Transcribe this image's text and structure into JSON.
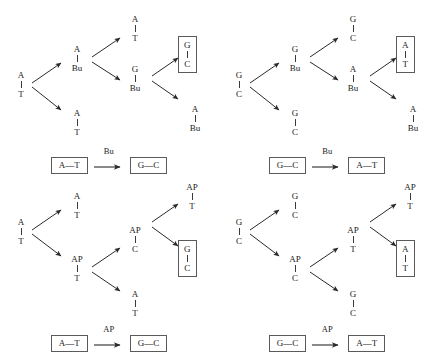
{
  "figure": {
    "top_caption": "",
    "bond_glyph": "|",
    "pair_dash": "—"
  },
  "panels": [
    {
      "id": "panel-bu-at-to-gc",
      "position": "top-left",
      "mutagen": "Bu",
      "root": {
        "top": "A",
        "bot": "T"
      },
      "gen1": [
        {
          "top": "A",
          "bot": "Bu",
          "boxed": false
        },
        {
          "top": "A",
          "bot": "T",
          "boxed": false
        }
      ],
      "gen2": [
        {
          "top": "A",
          "bot": "T",
          "boxed": false
        },
        {
          "top": "G",
          "bot": "Bu",
          "boxed": false
        }
      ],
      "gen3": [
        {
          "top": "G",
          "bot": "C",
          "boxed": true
        },
        {
          "top": "A",
          "bot": "Bu",
          "boxed": false
        }
      ],
      "summary": {
        "from": "A—T",
        "agent": "Bu",
        "to": "G—C"
      }
    },
    {
      "id": "panel-bu-gc-to-at",
      "position": "top-right",
      "mutagen": "Bu",
      "root": {
        "top": "G",
        "bot": "C"
      },
      "gen1": [
        {
          "top": "G",
          "bot": "Bu",
          "boxed": false
        },
        {
          "top": "G",
          "bot": "C",
          "boxed": false
        }
      ],
      "gen2": [
        {
          "top": "G",
          "bot": "C",
          "boxed": false
        },
        {
          "top": "A",
          "bot": "Bu",
          "boxed": false
        }
      ],
      "gen3": [
        {
          "top": "A",
          "bot": "T",
          "boxed": true
        },
        {
          "top": "A",
          "bot": "Bu",
          "boxed": false
        }
      ],
      "summary": {
        "from": "G—C",
        "agent": "Bu",
        "to": "A—T"
      }
    },
    {
      "id": "panel-ap-at-to-gc",
      "position": "bottom-left",
      "mutagen": "AP",
      "root": {
        "top": "A",
        "bot": "T"
      },
      "gen1": [
        {
          "top": "A",
          "bot": "T",
          "boxed": false
        },
        {
          "top": "AP",
          "bot": "T",
          "boxed": false
        }
      ],
      "gen2": [
        {
          "top": "AP",
          "bot": "C",
          "boxed": false
        },
        {
          "top": "A",
          "bot": "T",
          "boxed": false
        }
      ],
      "gen3": [
        {
          "top": "AP",
          "bot": "T",
          "boxed": false
        },
        {
          "top": "G",
          "bot": "C",
          "boxed": true
        }
      ],
      "summary": {
        "from": "A—T",
        "agent": "AP",
        "to": "G—C"
      }
    },
    {
      "id": "panel-ap-gc-to-at",
      "position": "bottom-right",
      "mutagen": "AP",
      "root": {
        "top": "G",
        "bot": "C"
      },
      "gen1": [
        {
          "top": "G",
          "bot": "C",
          "boxed": false
        },
        {
          "top": "AP",
          "bot": "C",
          "boxed": false
        }
      ],
      "gen2": [
        {
          "top": "AP",
          "bot": "T",
          "boxed": false
        },
        {
          "top": "G",
          "bot": "C",
          "boxed": false
        }
      ],
      "gen3": [
        {
          "top": "AP",
          "bot": "T",
          "boxed": false
        },
        {
          "top": "A",
          "bot": "T",
          "boxed": true
        }
      ],
      "summary": {
        "from": "G—C",
        "agent": "AP",
        "to": "A—T"
      }
    }
  ],
  "colors": {
    "ink": "#1a1a1a",
    "rule": "#3a3a3a",
    "box_border": "#5a5a5a",
    "background": "#ffffff"
  }
}
